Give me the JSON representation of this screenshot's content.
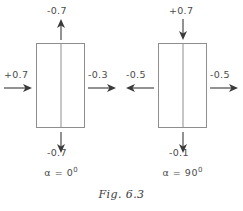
{
  "figure": {
    "caption": "Fig. 6.3",
    "stroke_color": "#8e8e8e",
    "text_color": "#4a4a4a",
    "background_color": "#ffffff"
  },
  "diagrams": [
    {
      "id": "alpha-0",
      "alpha_symbol": "α",
      "alpha_equals": "=",
      "alpha_value": "0",
      "alpha_unit": "0",
      "arrows": {
        "top": {
          "label": "-0.7",
          "direction": "up",
          "icon": "arrow-up-icon"
        },
        "bottom": {
          "label": "-0.7",
          "direction": "down",
          "icon": "arrow-down-icon"
        },
        "left": {
          "label": "+0.7",
          "direction": "right",
          "icon": "arrow-right-icon"
        },
        "right": {
          "label": "-0.3",
          "direction": "right",
          "icon": "arrow-right-icon"
        }
      }
    },
    {
      "id": "alpha-90",
      "alpha_symbol": "α",
      "alpha_equals": "=",
      "alpha_value": "90",
      "alpha_unit": "0",
      "arrows": {
        "top": {
          "label": "+0.7",
          "direction": "down",
          "icon": "arrow-down-icon"
        },
        "bottom": {
          "label": "-0.1",
          "direction": "down",
          "icon": "arrow-down-icon"
        },
        "left": {
          "label": "-0.5",
          "direction": "left",
          "icon": "arrow-left-icon"
        },
        "right": {
          "label": "-0.5",
          "direction": "right",
          "icon": "arrow-right-icon"
        }
      }
    }
  ]
}
